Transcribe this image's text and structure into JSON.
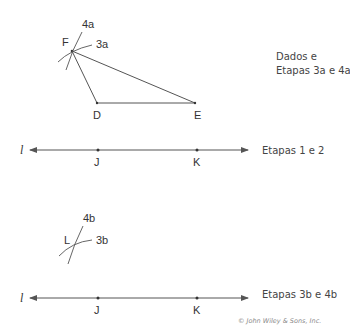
{
  "figure_a": {
    "points": {
      "F": "F",
      "D": "D",
      "E": "E"
    },
    "arc_labels": {
      "a4": "4a",
      "a3": "3a"
    },
    "caption_line1": "Dados e",
    "caption_line2": "Etapas 3a e 4a"
  },
  "line_1": {
    "line_name": "l",
    "points": {
      "J": "J",
      "K": "K"
    },
    "caption": "Etapas 1 e 2"
  },
  "figure_b": {
    "point": "L",
    "arc_labels": {
      "b4": "4b",
      "b3": "3b"
    }
  },
  "line_2": {
    "line_name": "l",
    "points": {
      "J": "J",
      "K": "K"
    },
    "caption": "Etapas 3b e 4b"
  },
  "copyright": "© John Wiley & Sons, Inc.",
  "colors": {
    "stroke": "#555555",
    "text": "#333333"
  }
}
